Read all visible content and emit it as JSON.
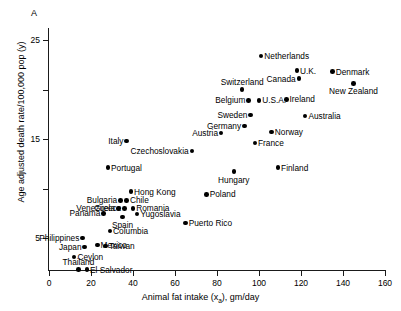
{
  "panel": {
    "label": "A"
  },
  "chart_data": {
    "type": "scatter",
    "title": "A",
    "xlabel": "Animal fat intake (xₐ), gm/day",
    "ylabel": "Age adjusted death rate/100,000 pop (y)",
    "xlim": [
      0,
      160
    ],
    "ylim": [
      0,
      28
    ],
    "grid": false,
    "legend": null,
    "xticks": [
      0,
      20,
      40,
      60,
      80,
      100,
      120,
      140,
      160
    ],
    "xtick_labels": [
      "0",
      "20",
      "40",
      "60",
      "80",
      "100",
      "120",
      "140",
      "160"
    ],
    "yticks": [
      5,
      10,
      15,
      20,
      25
    ],
    "ytick_labels": [
      "5",
      "",
      "15",
      "",
      "25"
    ],
    "points": [
      {
        "name": "Netherlands",
        "x": 101,
        "y": 23.4,
        "label_pos": "right"
      },
      {
        "name": "U.K.",
        "x": 118,
        "y": 21.9,
        "label_pos": "right"
      },
      {
        "name": "Denmark",
        "x": 135,
        "y": 21.8,
        "label_pos": "right"
      },
      {
        "name": "Canada",
        "x": 119,
        "y": 21.1,
        "label_pos": "left"
      },
      {
        "name": "New Zealand",
        "x": 145,
        "y": 20.6,
        "label_pos": "below"
      },
      {
        "name": "Switzerland",
        "x": 92,
        "y": 20.0,
        "label_pos": "above"
      },
      {
        "name": "Belgium",
        "x": 95,
        "y": 18.9,
        "label_pos": "left"
      },
      {
        "name": "U.S.A.",
        "x": 100,
        "y": 18.9,
        "label_pos": "right"
      },
      {
        "name": "Ireland",
        "x": 113,
        "y": 19.0,
        "label_pos": "right"
      },
      {
        "name": "Sweden",
        "x": 96,
        "y": 17.4,
        "label_pos": "left"
      },
      {
        "name": "Australia",
        "x": 122,
        "y": 17.3,
        "label_pos": "right"
      },
      {
        "name": "Germany",
        "x": 93,
        "y": 16.3,
        "label_pos": "left"
      },
      {
        "name": "Austria",
        "x": 82,
        "y": 15.6,
        "label_pos": "left"
      },
      {
        "name": "Norway",
        "x": 106,
        "y": 15.7,
        "label_pos": "right"
      },
      {
        "name": "France",
        "x": 98,
        "y": 14.6,
        "label_pos": "right"
      },
      {
        "name": "Italy",
        "x": 37,
        "y": 14.8,
        "label_pos": "left"
      },
      {
        "name": "Czechoslovakia",
        "x": 68,
        "y": 13.8,
        "label_pos": "left"
      },
      {
        "name": "Finland",
        "x": 109,
        "y": 12.1,
        "label_pos": "right"
      },
      {
        "name": "Hungary",
        "x": 88,
        "y": 11.7,
        "label_pos": "below"
      },
      {
        "name": "Portugal",
        "x": 28,
        "y": 12.1,
        "label_pos": "right"
      },
      {
        "name": "Hong Kong",
        "x": 39,
        "y": 9.7,
        "label_pos": "right"
      },
      {
        "name": "Poland",
        "x": 75,
        "y": 9.4,
        "label_pos": "right"
      },
      {
        "name": "Bulgaria",
        "x": 34,
        "y": 8.8,
        "label_pos": "left"
      },
      {
        "name": "Chile",
        "x": 37,
        "y": 8.8,
        "label_pos": "right"
      },
      {
        "name": "Venezuela",
        "x": 33,
        "y": 8.0,
        "label_pos": "left"
      },
      {
        "name": "Greece",
        "x": 36,
        "y": 8.0,
        "label_pos": "left"
      },
      {
        "name": "Romania",
        "x": 40,
        "y": 8.0,
        "label_pos": "right"
      },
      {
        "name": "Yugoslavia",
        "x": 42,
        "y": 7.4,
        "label_pos": "right"
      },
      {
        "name": "Panama",
        "x": 26,
        "y": 7.5,
        "label_pos": "left"
      },
      {
        "name": "Spain",
        "x": 35,
        "y": 7.1,
        "label_pos": "below"
      },
      {
        "name": "Puerto Rico",
        "x": 65,
        "y": 6.5,
        "label_pos": "right"
      },
      {
        "name": "Columbia",
        "x": 29,
        "y": 5.7,
        "label_pos": "right"
      },
      {
        "name": "Philippines",
        "x": 16,
        "y": 5.0,
        "label_pos": "left"
      },
      {
        "name": "Mexico",
        "x": 23,
        "y": 4.3,
        "label_pos": "right"
      },
      {
        "name": "Taiwan",
        "x": 27,
        "y": 4.2,
        "label_pos": "right"
      },
      {
        "name": "Japan",
        "x": 17,
        "y": 4.1,
        "label_pos": "left"
      },
      {
        "name": "Ceylon",
        "x": 12,
        "y": 3.1,
        "label_pos": "right"
      },
      {
        "name": "Thailand",
        "x": 14,
        "y": 1.8,
        "label_pos": "above"
      },
      {
        "name": "El Salvador",
        "x": 18,
        "y": 1.8,
        "label_pos": "right"
      }
    ]
  }
}
